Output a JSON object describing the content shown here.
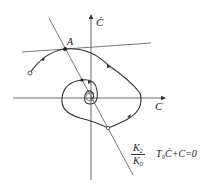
{
  "diagram": {
    "type": "phase-plane",
    "axes": {
      "x_label": "C",
      "y_label": "Ċ"
    },
    "points": [
      {
        "label": "A"
      }
    ],
    "annotations": {
      "fraction_numerator": "K₂",
      "fraction_denominator": "K₀",
      "equation": "T₀Ċ+C=0"
    },
    "colors": {
      "line": "#333333",
      "background": "#ffffff"
    }
  }
}
